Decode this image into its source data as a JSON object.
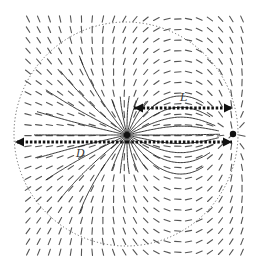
{
  "diagram": {
    "type": "vector-field",
    "width": 263,
    "height": 269,
    "colors": {
      "background": "#ffffff",
      "field": "#555555",
      "field_strong": "#222222",
      "circle": "#666666",
      "arrow": "#111111"
    },
    "grid": {
      "x0": 28,
      "y0": 19,
      "dx": 10.7,
      "dy": 10.6,
      "cols": 21,
      "rows": 23
    },
    "source": {
      "x": 127,
      "y": 135
    },
    "point": {
      "x": 233,
      "y": 134
    },
    "circle": {
      "cx": 126,
      "cy": 134,
      "r": 112
    },
    "arrows": [
      {
        "name": "L",
        "x1": 134,
        "y1": 108,
        "x2": 233,
        "y2": 108,
        "heads": "both"
      },
      {
        "name": "D",
        "x1": 127,
        "y1": 142,
        "x2": 15,
        "y2": 142,
        "heads": "end"
      },
      {
        "name": "D-right",
        "x1": 127,
        "y1": 142,
        "x2": 232,
        "y2": 142,
        "heads": "end"
      }
    ],
    "labels": {
      "L": {
        "text": "L",
        "x": 180,
        "y": 92
      },
      "D": {
        "text": "D",
        "x": 76,
        "y": 148
      }
    }
  }
}
